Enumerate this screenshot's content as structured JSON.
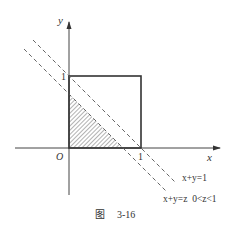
{
  "figure": {
    "caption_prefix": "图",
    "caption_number": "3-16",
    "axes": {
      "x_label": "x",
      "y_label": "y",
      "origin_label": "O",
      "x_tick_label": "1",
      "y_tick_label": "1"
    },
    "lines": [
      {
        "name": "line-x-plus-y-eq-1",
        "label": "x+y=1",
        "style": "dashed"
      },
      {
        "name": "line-x-plus-y-eq-z",
        "label": "x+y=z  0<z<1",
        "style": "dashed"
      }
    ],
    "shapes": {
      "unit_square": "0≤x≤1, 0≤y≤1",
      "shaded_region": "x≥0, y≥0, x+y≤z"
    },
    "colors": {
      "stroke": "#333333",
      "hatch": "#555555",
      "background": "#ffffff"
    }
  }
}
